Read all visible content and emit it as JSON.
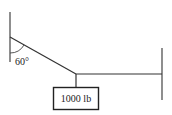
{
  "diagram": {
    "angle_label": "60°",
    "weight_label": "1000 lb",
    "colors": {
      "line": "#333333",
      "box_border": "#222222"
    },
    "elements": {
      "left_wall": {
        "x": 10,
        "y1": 12,
        "y2": 62
      },
      "right_wall": {
        "x": 162,
        "y1": 48,
        "y2": 100
      },
      "diagonal_cable": {
        "x1": 10,
        "y1": 37,
        "x2": 76,
        "y2": 74
      },
      "horizontal_cable": {
        "x1": 76,
        "y1": 74,
        "x2": 162,
        "y2": 74
      },
      "hanger": {
        "x": 76,
        "y1": 74,
        "y2": 87
      },
      "weight_box": {
        "x": 53,
        "y": 87,
        "w": 46,
        "h": 23
      }
    }
  }
}
